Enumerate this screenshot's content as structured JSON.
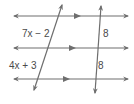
{
  "diagram": {
    "type": "parallel-lines-transversals",
    "line_color": "#6e6e6e",
    "text_color": "#4a4a4a",
    "parallel_lines": [
      {
        "id": "line-1",
        "y": 16,
        "x1": 14,
        "x2": 128,
        "marker_x": 78
      },
      {
        "id": "line-2",
        "y": 48,
        "x1": 14,
        "x2": 128,
        "marker_x": 73
      },
      {
        "id": "line-3",
        "y": 79,
        "x1": 14,
        "x2": 128,
        "marker_x": 67
      }
    ],
    "transversals": [
      {
        "id": "left-transversal",
        "x1": 62,
        "y1": 5,
        "x2": 34,
        "y2": 90
      },
      {
        "id": "right-transversal",
        "x1": 101,
        "y1": 6,
        "x2": 95,
        "y2": 93
      }
    ],
    "labels": {
      "left_top_segment": "7x − 2",
      "left_bottom_segment": "4x + 3",
      "right_top_segment": "8",
      "right_bottom_segment": "8"
    }
  }
}
